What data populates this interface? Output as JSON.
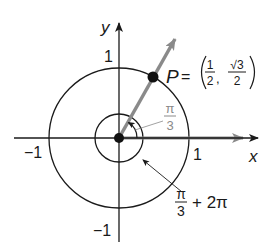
{
  "diagram": {
    "axes": {
      "x_label": "x",
      "y_label": "y",
      "tick_x_pos": "1",
      "tick_x_neg": "−1",
      "tick_y_pos": "1",
      "tick_y_neg": "−1"
    },
    "point": {
      "name": "P",
      "equals": "=",
      "x_num": "1",
      "x_den": "2",
      "comma": ",",
      "y_num": "√3",
      "y_den": "2"
    },
    "angle_small": {
      "num": "π",
      "den": "3"
    },
    "angle_big": {
      "num": "π",
      "den": "3",
      "suffix": "+ 2π"
    },
    "colors": {
      "ink": "#1a1a1a",
      "terminal_ray": "#8a8a8a",
      "angle_label": "#8a8a8a"
    }
  }
}
